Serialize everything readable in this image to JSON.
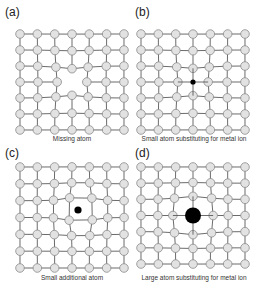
{
  "figure": {
    "panels": [
      {
        "id": "a",
        "label": "(a)",
        "caption": "Missing atom",
        "defect": "vacancy"
      },
      {
        "id": "b",
        "label": "(b)",
        "caption": "Small atom substituting for metal ion",
        "defect": "small-substitutional"
      },
      {
        "id": "c",
        "label": "(c)",
        "caption": "Small additional atom",
        "defect": "interstitial"
      },
      {
        "id": "d",
        "label": "(d)",
        "caption": "Large atom substituting for metal ion",
        "defect": "large-substitutional"
      }
    ],
    "lattice": {
      "rows": 7,
      "cols": 7
    },
    "colors": {
      "atom_fill": "#e2e2e2",
      "atom_stroke": "#8a8a8a",
      "bond": "#5a5a5a",
      "defect": "#000000"
    }
  }
}
